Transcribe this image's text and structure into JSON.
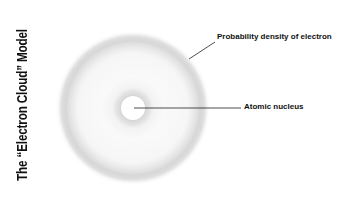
{
  "title": "The “Electron Cloud” Model",
  "labels": {
    "electron_cloud": "Probability density of electron",
    "nucleus": "Atomic nucleus"
  },
  "colors": {
    "background": "#ffffff",
    "cloud": "#c8c8c8",
    "line": "#222222",
    "text": "#111111"
  }
}
